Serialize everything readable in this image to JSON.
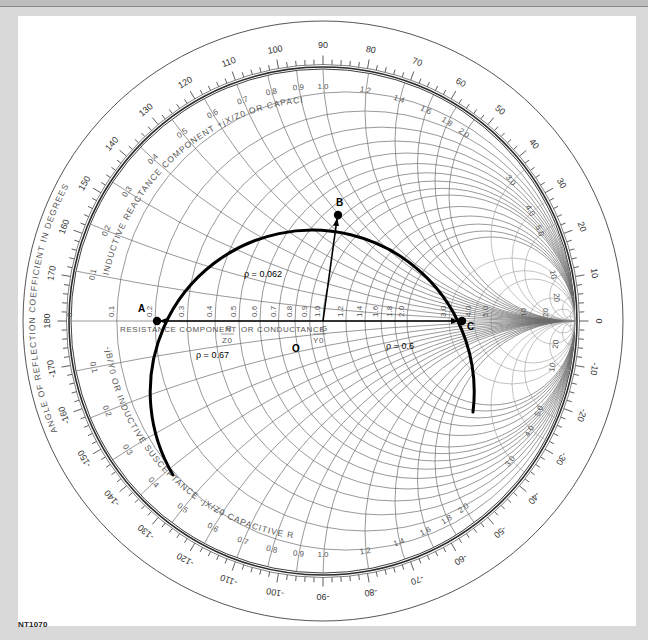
{
  "figure": {
    "id_label": "NT1070",
    "type": "Smith chart"
  },
  "geometry": {
    "cx": 323,
    "cy": 321,
    "R": 252,
    "scale_inner": 254,
    "scale_outer": 268,
    "outer_ellipse_rx": 300,
    "outer_ellipse_ry": 300
  },
  "axis_labels": {
    "angle_scale_title": "ANGLE OF REFLECTION COEFFICIENT IN DEGREES",
    "resistance_axis": "RESISTANCE COMPONENT  R/Z0  OR CONDUCTANCE  G/Y0",
    "resistance_text": "RESISTANCE COMPONENT",
    "resistance_frac_num": "R",
    "resistance_frac_den": "Z",
    "resistance_frac_sub": "0",
    "or_conductance": "OR CONDUCTANCE",
    "conductance_frac_num": "G",
    "conductance_frac_den": "Y",
    "conductance_frac_sub": "0",
    "inductive_upper": "INDUCTIVE REACTANCE COMPONENT +jX/Z0 OR CAPACITIVE SUSCEPTANCE +jB/Y0",
    "inductive_upper_a": "INDUCTIVE REACTANCE COMPONENT",
    "inductive_upper_frac": "+jX/Z0",
    "inductive_upper_b": "OR CAPACITIVE SUSCEPTANCE",
    "inductive_upper_frac2": "+jB/Y0",
    "capacitive_lower_a": "CAPACITIVE REACTANCE COMPONENT",
    "capacitive_lower_frac": "-jX/Z0",
    "capacitive_lower_b": "OR INDUCTIVE SUSCEPTANCE",
    "capacitive_lower_frac2": "-jB/Y0"
  },
  "angle_scale": {
    "major_labels": [
      {
        "deg": 0,
        "text": "0"
      },
      {
        "deg": 10,
        "text": "10"
      },
      {
        "deg": 20,
        "text": "20"
      },
      {
        "deg": 30,
        "text": "30"
      },
      {
        "deg": 40,
        "text": "40"
      },
      {
        "deg": 50,
        "text": "50"
      },
      {
        "deg": 60,
        "text": "60"
      },
      {
        "deg": 70,
        "text": "70"
      },
      {
        "deg": 80,
        "text": "80"
      },
      {
        "deg": 90,
        "text": "90"
      },
      {
        "deg": 100,
        "text": "100"
      },
      {
        "deg": 110,
        "text": "110"
      },
      {
        "deg": 120,
        "text": "120"
      },
      {
        "deg": 130,
        "text": "130"
      },
      {
        "deg": 140,
        "text": "140"
      },
      {
        "deg": 150,
        "text": "150"
      },
      {
        "deg": 160,
        "text": "160"
      },
      {
        "deg": 170,
        "text": "170"
      },
      {
        "deg": 180,
        "text": "180"
      },
      {
        "deg": -10,
        "text": "-10"
      },
      {
        "deg": -20,
        "text": "-20"
      },
      {
        "deg": -30,
        "text": "-30"
      },
      {
        "deg": -40,
        "text": "-40"
      },
      {
        "deg": -50,
        "text": "-50"
      },
      {
        "deg": -60,
        "text": "-60"
      },
      {
        "deg": -70,
        "text": "-70"
      },
      {
        "deg": -80,
        "text": "-80"
      },
      {
        "deg": -90,
        "text": "-90"
      },
      {
        "deg": -100,
        "text": "-100"
      },
      {
        "deg": -110,
        "text": "-110"
      },
      {
        "deg": -120,
        "text": "-120"
      },
      {
        "deg": -130,
        "text": "-130"
      },
      {
        "deg": -140,
        "text": "-140"
      },
      {
        "deg": -150,
        "text": "-150"
      },
      {
        "deg": -160,
        "text": "-160"
      },
      {
        "deg": -170,
        "text": "-170"
      }
    ],
    "minor_step_deg": 2
  },
  "resistance_circles": [
    0.1,
    0.2,
    0.3,
    0.4,
    0.5,
    0.6,
    0.7,
    0.8,
    0.9,
    1.0,
    1.2,
    1.4,
    1.6,
    1.8,
    2.0,
    3.0,
    4.0,
    5.0,
    10,
    20,
    50
  ],
  "resistance_labels": [
    {
      "r": 0.1,
      "text": "0.1"
    },
    {
      "r": 0.2,
      "text": "0.2"
    },
    {
      "r": 0.3,
      "text": "0.3"
    },
    {
      "r": 0.4,
      "text": "0.4"
    },
    {
      "r": 0.5,
      "text": "0.5"
    },
    {
      "r": 0.6,
      "text": "0.6"
    },
    {
      "r": 0.7,
      "text": "0.7"
    },
    {
      "r": 0.8,
      "text": "0.8"
    },
    {
      "r": 0.9,
      "text": "0.9"
    },
    {
      "r": 1.0,
      "text": "1.0"
    },
    {
      "r": 1.2,
      "text": "1.2"
    },
    {
      "r": 1.4,
      "text": "1.4"
    },
    {
      "r": 1.6,
      "text": "1.6"
    },
    {
      "r": 1.8,
      "text": "1.8"
    },
    {
      "r": 2.0,
      "text": "2.0"
    },
    {
      "r": 3.0,
      "text": "3.0"
    },
    {
      "r": 4.0,
      "text": "4.0"
    },
    {
      "r": 5.0,
      "text": "5.0"
    },
    {
      "r": 10,
      "text": "10"
    },
    {
      "r": 20,
      "text": "20"
    }
  ],
  "reactance_arcs": [
    0.1,
    0.2,
    0.3,
    0.4,
    0.5,
    0.6,
    0.7,
    0.8,
    0.9,
    1.0,
    1.2,
    1.4,
    1.6,
    1.8,
    2.0,
    3.0,
    4.0,
    5.0,
    10,
    20,
    50
  ],
  "reactance_labels": [
    {
      "x": 0.1,
      "text": "0.1"
    },
    {
      "x": 0.2,
      "text": "0.2"
    },
    {
      "x": 0.3,
      "text": "0.3"
    },
    {
      "x": 0.4,
      "text": "0.4"
    },
    {
      "x": 0.5,
      "text": "0.5"
    },
    {
      "x": 0.6,
      "text": "0.6"
    },
    {
      "x": 0.7,
      "text": "0.7"
    },
    {
      "x": 0.8,
      "text": "0.8"
    },
    {
      "x": 0.9,
      "text": "0.9"
    },
    {
      "x": 1.0,
      "text": "1.0"
    },
    {
      "x": 1.2,
      "text": "1.2"
    },
    {
      "x": 1.4,
      "text": "1.4"
    },
    {
      "x": 1.6,
      "text": "1.6"
    },
    {
      "x": 1.8,
      "text": "1.8"
    },
    {
      "x": 2.0,
      "text": "2.0"
    },
    {
      "x": 3.0,
      "text": "3.0"
    },
    {
      "x": 4.0,
      "text": "4.0"
    },
    {
      "x": 5.0,
      "text": "5.0"
    },
    {
      "x": 10,
      "text": "10"
    },
    {
      "x": 20,
      "text": "20"
    }
  ],
  "left_zero_label": "0",
  "overlay": {
    "arc_path": "M 173 475 A 162 162 0 1 1 473 412",
    "points": [
      {
        "id": "A",
        "label": "A",
        "x": 157,
        "y": 321,
        "lx": 138,
        "ly": 312
      },
      {
        "id": "B",
        "label": "B",
        "x": 338,
        "y": 215,
        "lx": 336,
        "ly": 206
      },
      {
        "id": "C",
        "label": "C",
        "x": 462,
        "y": 321,
        "lx": 467,
        "ly": 330
      },
      {
        "id": "O",
        "label": "O",
        "x": 323,
        "y": 321,
        "lx": 292,
        "ly": 352
      }
    ],
    "vectors": [
      {
        "name": "vector-to-A",
        "x1": 323,
        "y1": 321,
        "x2": 160,
        "y2": 321
      },
      {
        "name": "vector-to-B",
        "x1": 323,
        "y1": 321,
        "x2": 337,
        "y2": 219
      },
      {
        "name": "vector-to-C",
        "x1": 323,
        "y1": 321,
        "x2": 458,
        "y2": 321
      }
    ],
    "rho_labels": [
      {
        "text": "ρ = 0.062",
        "x": 244,
        "y": 277
      },
      {
        "text": "ρ = 0.67",
        "x": 196,
        "y": 358
      },
      {
        "text": "ρ = 0.6",
        "x": 386,
        "y": 349
      }
    ]
  },
  "chart_data": {
    "type": "smith_chart",
    "points": [
      {
        "label": "A",
        "normalized_resistance": 0.2,
        "reactance": 0
      },
      {
        "label": "B",
        "normalized_resistance": 1.0,
        "reactance": 1.0
      },
      {
        "label": "C",
        "normalized_resistance": 4.0,
        "reactance": 0
      },
      {
        "label": "O",
        "normalized_resistance": 1.0,
        "reactance": 0
      }
    ],
    "annotations": [
      "ρ = 0.062",
      "ρ = 0.67",
      "ρ = 0.6"
    ],
    "angle_scale_range_deg": [
      -180,
      180
    ],
    "figure_id": "NT1070"
  }
}
